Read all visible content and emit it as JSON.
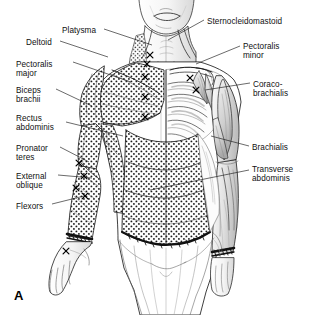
{
  "figure": {
    "panel_letter": "A",
    "view": "anterior",
    "background_color": "#ffffff",
    "ink_color": "#1a1a1a",
    "width": 313,
    "height": 315
  },
  "labels_left": [
    {
      "name": "platysma",
      "text": "Platysma",
      "x": 62,
      "y": 26,
      "lines": [
        "Platysma"
      ]
    },
    {
      "name": "deltoid",
      "text": "Deltoid",
      "x": 26,
      "y": 38,
      "lines": [
        "Deltoid"
      ]
    },
    {
      "name": "pectoralis-major",
      "text": "Pectoralis major",
      "x": 16,
      "y": 60,
      "lines": [
        "Pectoralis",
        "major"
      ]
    },
    {
      "name": "biceps-brachii",
      "text": "Biceps brachii",
      "x": 16,
      "y": 86,
      "lines": [
        "Biceps",
        "brachii"
      ]
    },
    {
      "name": "rectus-abdominis",
      "text": "Rectus abdominis",
      "x": 16,
      "y": 114,
      "lines": [
        "Rectus",
        "abdominis"
      ]
    },
    {
      "name": "pronator-teres",
      "text": "Pronator teres",
      "x": 16,
      "y": 144,
      "lines": [
        "Pronator",
        "teres"
      ]
    },
    {
      "name": "external-oblique",
      "text": "External oblique",
      "x": 16,
      "y": 172,
      "lines": [
        "External",
        "oblique"
      ]
    },
    {
      "name": "flexors",
      "text": "Flexors",
      "x": 16,
      "y": 202,
      "lines": [
        "Flexors"
      ]
    }
  ],
  "labels_right": [
    {
      "name": "sternocleidomastoid",
      "text": "Sternocleidomastoid",
      "x": 207,
      "y": 17,
      "lines": [
        "Sternocleidomastoid"
      ]
    },
    {
      "name": "pectoralis-minor",
      "text": "Pectoralis minor",
      "x": 243,
      "y": 42,
      "lines": [
        "Pectoralis",
        "minor"
      ]
    },
    {
      "name": "coraco-brachialis",
      "text": "Coraco-brachialis",
      "x": 253,
      "y": 80,
      "lines": [
        "Coraco-",
        "brachialis"
      ]
    },
    {
      "name": "brachialis",
      "text": "Brachialis",
      "x": 252,
      "y": 143,
      "lines": [
        "Brachialis"
      ]
    },
    {
      "name": "transverse-abdominis",
      "text": "Transverse abdominis",
      "x": 252,
      "y": 165,
      "lines": [
        "Transverse",
        "abdominis"
      ]
    }
  ],
  "leaders_left": [
    {
      "name": "leader-platysma",
      "x1": 104,
      "y1": 29,
      "x2": 152,
      "y2": 45
    },
    {
      "name": "leader-deltoid",
      "x1": 60,
      "y1": 41,
      "x2": 108,
      "y2": 57
    },
    {
      "name": "leader-pectoralis-major",
      "x1": 73,
      "y1": 62,
      "x2": 131,
      "y2": 82
    },
    {
      "name": "leader-biceps-brachii",
      "x1": 56,
      "y1": 89,
      "x2": 92,
      "y2": 106
    },
    {
      "name": "leader-rectus-abdominis",
      "x1": 66,
      "y1": 122,
      "x2": 123,
      "y2": 136
    },
    {
      "name": "leader-pronator-teres",
      "x1": 60,
      "y1": 147,
      "x2": 89,
      "y2": 162
    },
    {
      "name": "leader-external-oblique",
      "x1": 58,
      "y1": 175,
      "x2": 92,
      "y2": 178
    },
    {
      "name": "leader-flexors",
      "x1": 52,
      "y1": 204,
      "x2": 84,
      "y2": 196
    }
  ],
  "leaders_right": [
    {
      "name": "leader-sternocleidomastoid",
      "x1": 204,
      "y1": 20,
      "x2": 168,
      "y2": 40
    },
    {
      "name": "leader-pectoralis-minor",
      "x1": 240,
      "y1": 46,
      "x2": 196,
      "y2": 64
    },
    {
      "name": "leader-coraco-brachialis",
      "x1": 250,
      "y1": 83,
      "x2": 205,
      "y2": 90
    },
    {
      "name": "leader-brachialis",
      "x1": 249,
      "y1": 146,
      "x2": 211,
      "y2": 136
    },
    {
      "name": "leader-transverse-abdominis",
      "x1": 249,
      "y1": 170,
      "x2": 150,
      "y2": 190
    }
  ],
  "motor_points": [
    {
      "name": "motor-point-neck-1",
      "x": 150,
      "y": 55
    },
    {
      "name": "motor-point-neck-2",
      "x": 147,
      "y": 64
    },
    {
      "name": "motor-point-sternum-1",
      "x": 145,
      "y": 77
    },
    {
      "name": "motor-point-sternum-2",
      "x": 145,
      "y": 97
    },
    {
      "name": "motor-point-sternum-3",
      "x": 145,
      "y": 117
    },
    {
      "name": "motor-point-clavicle",
      "x": 190,
      "y": 78
    },
    {
      "name": "motor-point-axilla",
      "x": 196,
      "y": 90
    },
    {
      "name": "motor-point-forearm-1",
      "x": 79,
      "y": 163
    },
    {
      "name": "motor-point-forearm-2",
      "x": 84,
      "y": 176
    },
    {
      "name": "motor-point-forearm-3",
      "x": 76,
      "y": 188
    },
    {
      "name": "motor-point-forearm-4",
      "x": 85,
      "y": 196
    },
    {
      "name": "motor-point-hand",
      "x": 66,
      "y": 251
    }
  ]
}
